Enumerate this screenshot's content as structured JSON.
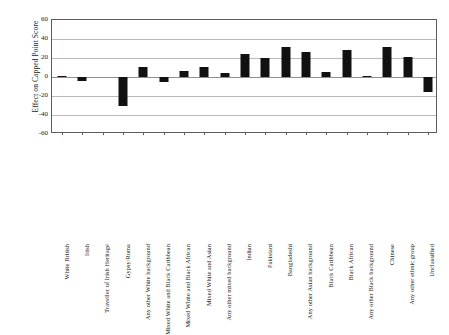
{
  "chart_data": {
    "type": "bar",
    "title": "",
    "subtitle": "",
    "xlabel": "",
    "ylabel": "Effect on Capped Point Score",
    "ylim": [
      -60,
      60
    ],
    "yticks": [
      60,
      40,
      20,
      0,
      -20,
      -40,
      -60
    ],
    "grid": true,
    "legend_position": "none",
    "bar_color": "#111111",
    "categories": [
      "White British",
      "Irish",
      "Traveller of Irish Heritage",
      "Gypsy/Roma",
      "Any other White background",
      "Mixed White and Black Caribbean",
      "Mixed White and Black African",
      "Mixed White and Asian",
      "Any other mixed background",
      "Indian",
      "Pakistani",
      "Bangladeshi",
      "Any other Asian background",
      "Black Caribbean",
      "Black African",
      "Any other Black background",
      "Chinese",
      "Any other ethnic group",
      "Unclassified"
    ],
    "values": [
      1,
      -4,
      0,
      -30,
      11,
      -5,
      6,
      11,
      4,
      24,
      20,
      32,
      26,
      5,
      28,
      1,
      32,
      21,
      -16
    ]
  },
  "axis": {
    "y_title": "Effect on Capped Point Score",
    "tick_labels": [
      "60",
      "40",
      "20",
      "0",
      "-20",
      "-40",
      "-60"
    ]
  }
}
